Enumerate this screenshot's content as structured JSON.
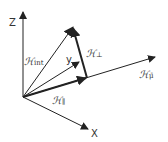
{
  "diagram": {
    "axes": {
      "x_label": "X",
      "y_label": "y",
      "z_label": "Z"
    },
    "vectors": {
      "int": {
        "symbol": "ℋ",
        "subscript": "int"
      },
      "parallel": {
        "symbol": "ℋ",
        "subscript": "∥"
      },
      "perp": {
        "symbol": "ℋ",
        "subscript": "⊥"
      },
      "mu": {
        "symbol": "ℋ",
        "subscript": "μ̄"
      }
    },
    "colors": {
      "stroke": "#222222",
      "text": "#333333"
    }
  }
}
